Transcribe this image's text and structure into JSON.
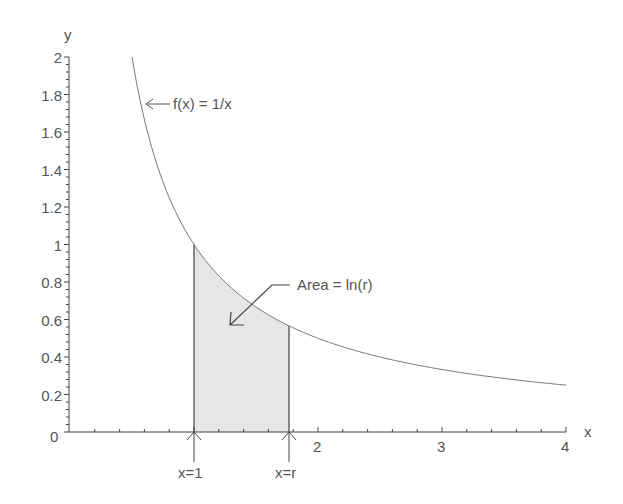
{
  "chart_data": {
    "type": "line",
    "title": "",
    "xlabel": "x",
    "ylabel": "y",
    "xlim": [
      0,
      4
    ],
    "ylim": [
      0,
      2
    ],
    "x_ticks": [
      "1",
      "2",
      "3",
      "4"
    ],
    "y_ticks": [
      "0",
      "0.2",
      "0.4",
      "0.6",
      "0.8",
      "1",
      "1.2",
      "1.4",
      "1.6",
      "1.8",
      "2"
    ],
    "origin_label": "0",
    "grid": false,
    "series": [
      {
        "name": "f(x) = 1/x",
        "function": "1/x",
        "x_range": [
          0.5,
          4
        ]
      }
    ],
    "shaded_region": {
      "from": 1,
      "to": 1.77,
      "fill": "#e6e6e6"
    },
    "annotations": [
      {
        "text": "f(x) = 1/x",
        "arrow_to": [
          0.62,
          1.72
        ]
      },
      {
        "text": "Area = ln(r)",
        "arrow_to": [
          1.3,
          0.57
        ]
      },
      {
        "text": "x=1",
        "arrow_to": [
          1,
          0
        ]
      },
      {
        "text": "x=r",
        "arrow_to": [
          1.77,
          0
        ]
      }
    ]
  },
  "labels": {
    "y_axis": "y",
    "x_axis": "x",
    "origin": "0",
    "func": "f(x) = 1/x",
    "area": "Area = ln(r)",
    "x1": "x=1",
    "xr": "x=r",
    "xt2": "2",
    "xt3": "3",
    "xt4": "4",
    "yt": [
      "0.2",
      "0.4",
      "0.6",
      "0.8",
      "1",
      "1.2",
      "1.4",
      "1.6",
      "1.8",
      "2"
    ]
  }
}
